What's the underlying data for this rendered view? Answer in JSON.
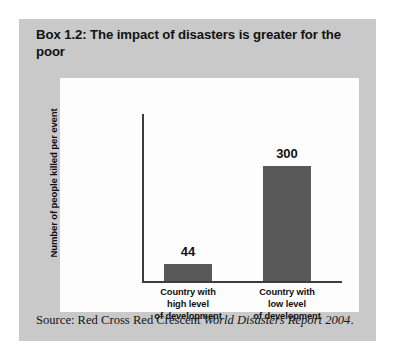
{
  "box": {
    "title": "Box 1.2: The impact of disasters is greater for the poor",
    "background_color": "#c9c9c9",
    "panel_color": "#fdfdfd"
  },
  "source": {
    "prefix": "Source: Red Cross Red Crescent ",
    "publication": "World Disasters Report 2004",
    "suffix": "."
  },
  "chart_data": {
    "type": "bar",
    "title": "",
    "categories": [
      "Country with high level of development",
      "Country with low level of development"
    ],
    "category_lines": [
      [
        "Country with",
        "high level",
        "of development"
      ],
      [
        "Country with",
        "low level",
        "of development"
      ]
    ],
    "values": [
      44,
      300
    ],
    "value_labels": [
      "44",
      "300"
    ],
    "xlabel": "",
    "ylabel": "Number of people killed per event",
    "ylim": [
      0,
      390
    ],
    "grid": false,
    "legend": false,
    "bar_color": "#59595a",
    "axis_color": "#3d3d3d"
  }
}
